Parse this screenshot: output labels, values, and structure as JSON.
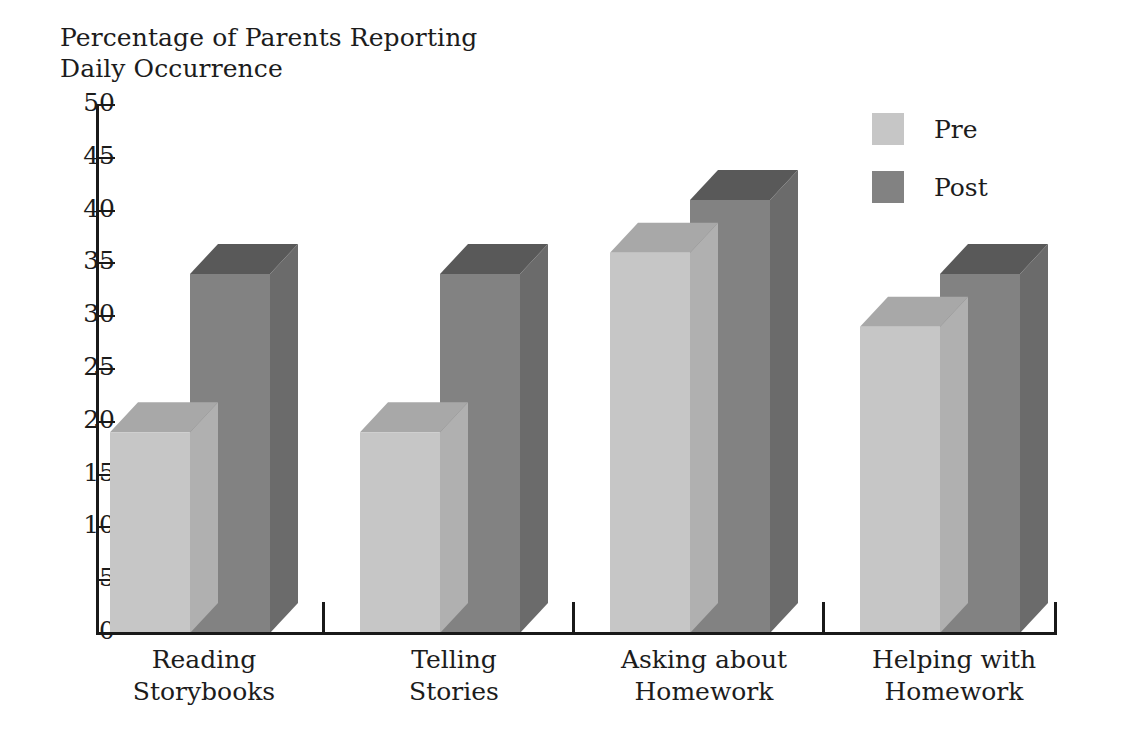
{
  "chart_data": {
    "type": "bar",
    "title": "Percentage of Parents Reporting\nDaily Occurrence",
    "xlabel": "",
    "ylabel": "",
    "ylim": [
      0,
      50
    ],
    "ytick_step": 5,
    "yticks": [
      "50",
      "45",
      "40",
      "35",
      "30",
      "25",
      "20",
      "15",
      "10",
      "5",
      "0"
    ],
    "grid": false,
    "legend_position": "top-right",
    "three_d": true,
    "categories": [
      "Reading\nStorybooks",
      "Telling\nStories",
      "Asking about\nHomework",
      "Helping with\nHomework"
    ],
    "series": [
      {
        "name": "Pre",
        "color": "#c6c6c6",
        "values": [
          19,
          19,
          36,
          29
        ]
      },
      {
        "name": "Post",
        "color": "#828282",
        "values": [
          34,
          34,
          41,
          34
        ]
      }
    ]
  },
  "legend": {
    "items": [
      {
        "label": "Pre",
        "color": "#c6c6c6"
      },
      {
        "label": "Post",
        "color": "#828282"
      }
    ]
  },
  "colors": {
    "pre_front": "#c6c6c6",
    "pre_top": "#a8a8a8",
    "pre_side": "#b0b0b0",
    "post_front": "#828282",
    "post_top": "#595959",
    "post_side": "#6b6b6b",
    "axis": "#191919",
    "text": "#1c1c1c",
    "background": "#ffffff"
  }
}
